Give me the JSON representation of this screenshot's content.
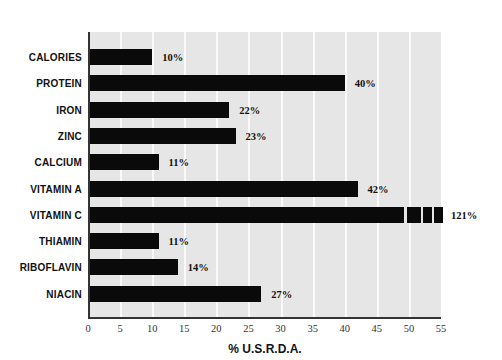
{
  "chart_data": {
    "type": "bar",
    "orientation": "horizontal",
    "title": "",
    "xlabel": "% U.S.R.D.A.",
    "ylabel": "",
    "xlim": [
      0,
      55
    ],
    "xticks": [
      0,
      5,
      10,
      15,
      20,
      25,
      30,
      35,
      40,
      45,
      50,
      55
    ],
    "grid": "vertical",
    "categories": [
      "CALORIES",
      "PROTEIN",
      "IRON",
      "ZINC",
      "CALCIUM",
      "VITAMIN A",
      "VITAMIN C",
      "THIAMIN",
      "RIBOFLAVIN",
      "NIACIN"
    ],
    "values": [
      10,
      40,
      22,
      23,
      11,
      42,
      121,
      11,
      14,
      27
    ],
    "labels": [
      "10%",
      "40%",
      "22%",
      "23%",
      "11%",
      "42%",
      "121%",
      "11%",
      "14%",
      "27%"
    ],
    "annotations": [
      "VITAMIN C bar truncated at axis limit with broken-bar segments (value 121%)"
    ],
    "colors": {
      "bar": "#0a0a0a",
      "plot_bg": "#e6e6e6",
      "grid": "#fafafa"
    }
  }
}
